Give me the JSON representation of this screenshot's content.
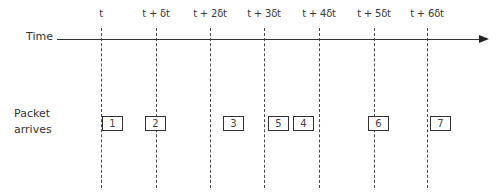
{
  "diagram": {
    "axis_label": "Time",
    "row_label_line1": "Packet",
    "row_label_line2": "arrives",
    "ticks": [
      {
        "label": "t",
        "x": 101
      },
      {
        "label": "t + δt",
        "x": 156
      },
      {
        "label": "t + 2δt",
        "x": 210
      },
      {
        "label": "t + 3δt",
        "x": 264
      },
      {
        "label": "t + 4δt",
        "x": 319
      },
      {
        "label": "t + 5δt",
        "x": 374
      },
      {
        "label": "t + 6δt",
        "x": 427
      }
    ],
    "packets": [
      {
        "label": "1",
        "x": 102
      },
      {
        "label": "2",
        "x": 145
      },
      {
        "label": "3",
        "x": 223
      },
      {
        "label": "5",
        "x": 268
      },
      {
        "label": "4",
        "x": 293
      },
      {
        "label": "6",
        "x": 368
      },
      {
        "label": "7",
        "x": 430
      }
    ],
    "colors": {
      "line": "#333333",
      "background": "#ffffff"
    }
  }
}
